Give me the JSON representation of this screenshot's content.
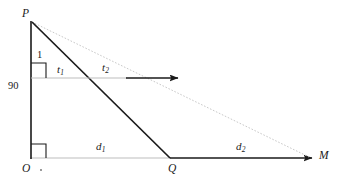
{
  "figure": {
    "type": "geometry-diagram",
    "background_color": "#ffffff",
    "stroke_color_solid": "#1a1a1a",
    "stroke_color_light": "#b8b8b8",
    "stroke_color_dotted": "#c9c9c9"
  },
  "points": {
    "P": {
      "label": "P",
      "x": 30,
      "y": 21
    },
    "O": {
      "label": "O",
      "x": 30,
      "y": 158
    },
    "Q": {
      "label": "Q",
      "x": 170,
      "y": 158
    },
    "M": {
      "label": "M",
      "x": 310,
      "y": 158
    }
  },
  "labels": {
    "depth_segment": "1",
    "angle_value": "90",
    "ray_upper_left": "t",
    "ray_upper_left_sub": "1",
    "ray_upper_right": "t",
    "ray_upper_right_sub": "2",
    "baseline_left": "d",
    "baseline_left_sub": "1",
    "baseline_right": "d",
    "baseline_right_sub": "2"
  },
  "markers": {
    "right_angle_upper": true,
    "right_angle_at_origin": true,
    "origin_dot": true,
    "arrow_t2": true,
    "arrow_to_M": true,
    "dotted_P_to_M": true
  }
}
